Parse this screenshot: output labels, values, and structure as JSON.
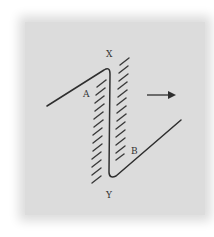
{
  "diagram": {
    "labels": {
      "x": "X",
      "y": "Y",
      "a": "A",
      "b": "B"
    },
    "colors": {
      "background": "#ffffff",
      "panel": "#dcdcdc",
      "stroke": "#333333"
    },
    "arrow_direction": "right",
    "hatch_left_count": 13,
    "hatch_right_count": 13
  }
}
